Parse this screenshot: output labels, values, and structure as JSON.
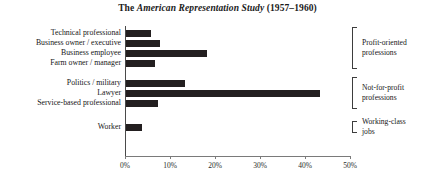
{
  "chart_data": {
    "type": "bar",
    "orientation": "horizontal",
    "title": "The American Representation Study (1957–1960)",
    "title_parts": {
      "lead": "The ",
      "italic": "American Representation Study",
      "trail": " (1957–1960)"
    },
    "xlabel": "",
    "ylabel": "",
    "xlim": [
      0,
      50
    ],
    "grid": false,
    "legend": false,
    "bar_color": "#231f20",
    "axis_color": "#4a4a4a",
    "categories": [
      "Technical professional",
      "Business owner / executive",
      "Business employee",
      "Farm owner / manager",
      "Politics / military",
      "Lawyer",
      "Service-based professional",
      "Worker"
    ],
    "values": [
      5.5,
      7.5,
      18,
      6.5,
      13,
      43,
      7,
      3.5
    ],
    "xticks": [
      0,
      10,
      20,
      30,
      40,
      50
    ],
    "xticklabels": [
      "0%",
      "10%",
      "20%",
      "30%",
      "40%",
      "50%"
    ],
    "groups": [
      {
        "label": "Profit-oriented professions",
        "label_line1": "Profit-oriented",
        "label_line2": "professions",
        "members": [
          "Technical professional",
          "Business owner / executive",
          "Business employee",
          "Farm owner / manager"
        ]
      },
      {
        "label": "Not-for-profit professions",
        "label_line1": "Not-for-profit",
        "label_line2": "professions",
        "members": [
          "Politics / military",
          "Lawyer",
          "Service-based professional"
        ]
      },
      {
        "label": "Working-class jobs",
        "label_line1": "Working-class",
        "label_line2": "jobs",
        "members": [
          "Worker"
        ]
      }
    ]
  }
}
